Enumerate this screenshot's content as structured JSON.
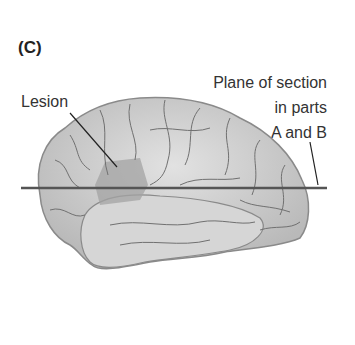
{
  "figure": {
    "panel_label": "(C)",
    "labels": {
      "lesion": "Lesion",
      "plane_line1": "Plane of section",
      "plane_line2": "in parts",
      "plane_line3": "A and B"
    },
    "colors": {
      "brain_fill": "#cfcfcf",
      "brain_outline": "#8a8a8a",
      "sulci": "#6f6f6f",
      "lesion": "#9d9d9d",
      "plane_line": "#555555",
      "leader": "#222222"
    }
  }
}
